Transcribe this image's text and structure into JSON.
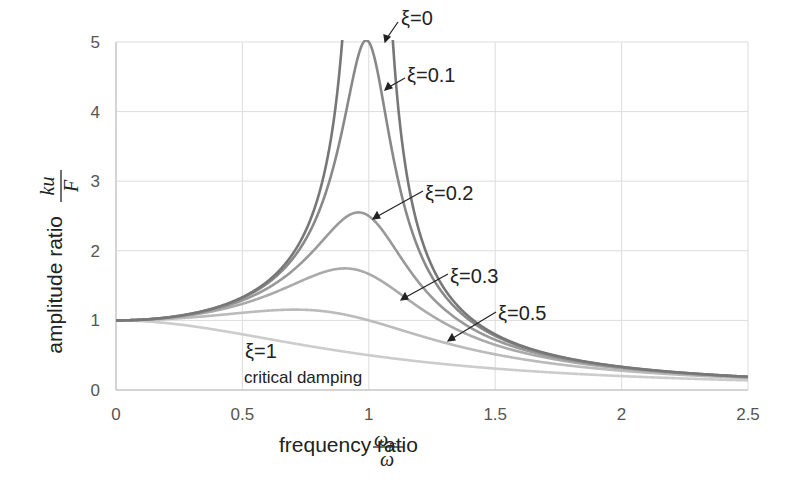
{
  "chart_data": {
    "type": "line",
    "title": "",
    "xlabel": "frequency ratio ωF/ω",
    "ylabel": "amplitude ratio ku/F",
    "xlim": [
      0,
      2.5
    ],
    "ylim": [
      0,
      5
    ],
    "xticks": [
      "0",
      "0.5",
      "1",
      "1.5",
      "2",
      "2.5"
    ],
    "yticks": [
      "0",
      "1",
      "2",
      "3",
      "4",
      "5"
    ],
    "grid": true,
    "legend": "inline annotations with arrows",
    "formula": "ku/F = 1 / sqrt((1 - r^2)^2 + (2 ξ r)^2)",
    "series": [
      {
        "name": "ξ=0",
        "xi": 0,
        "color": "#777777",
        "points": [
          [
            0,
            1
          ],
          [
            0.5,
            1.33
          ],
          [
            0.8,
            2.78
          ],
          [
            0.9,
            5.26
          ],
          [
            1.1,
            4.76
          ],
          [
            1.2,
            2.27
          ],
          [
            1.5,
            0.8
          ],
          [
            2,
            0.33
          ],
          [
            2.5,
            0.19
          ]
        ]
      },
      {
        "name": "ξ=0.1",
        "xi": 0.1,
        "color": "#888888",
        "points": [
          [
            0,
            1
          ],
          [
            0.5,
            1.32
          ],
          [
            0.8,
            2.54
          ],
          [
            0.9,
            3.82
          ],
          [
            1,
            5.0
          ],
          [
            1.1,
            3.29
          ],
          [
            1.2,
            2.02
          ],
          [
            1.5,
            0.78
          ],
          [
            2,
            0.33
          ],
          [
            2.5,
            0.19
          ]
        ]
      },
      {
        "name": "ξ=0.2",
        "xi": 0.2,
        "color": "#999999",
        "points": [
          [
            0,
            1
          ],
          [
            0.5,
            1.29
          ],
          [
            0.8,
            2.0
          ],
          [
            0.96,
            2.55
          ],
          [
            1,
            2.5
          ],
          [
            1.2,
            1.54
          ],
          [
            1.5,
            0.74
          ],
          [
            2,
            0.32
          ],
          [
            2.5,
            0.19
          ]
        ]
      },
      {
        "name": "ξ=0.3",
        "xi": 0.3,
        "color": "#aaaaaa",
        "points": [
          [
            0,
            1
          ],
          [
            0.5,
            1.24
          ],
          [
            0.9,
            1.75
          ],
          [
            1,
            1.67
          ],
          [
            1.2,
            1.19
          ],
          [
            1.5,
            0.67
          ],
          [
            2,
            0.31
          ],
          [
            2.5,
            0.18
          ]
        ]
      },
      {
        "name": "ξ=0.5",
        "xi": 0.5,
        "color": "#bbbbbb",
        "points": [
          [
            0,
            1
          ],
          [
            0.5,
            1.11
          ],
          [
            0.71,
            1.15
          ],
          [
            1,
            1.0
          ],
          [
            1.5,
            0.55
          ],
          [
            2,
            0.28
          ],
          [
            2.5,
            0.17
          ]
        ]
      },
      {
        "name": "ξ=1",
        "xi": 1,
        "color": "#cccccc",
        "points": [
          [
            0,
            1
          ],
          [
            0.5,
            0.8
          ],
          [
            1,
            0.5
          ],
          [
            1.5,
            0.31
          ],
          [
            2,
            0.2
          ],
          [
            2.5,
            0.14
          ]
        ]
      }
    ],
    "annotations": [
      {
        "text": "ξ=0"
      },
      {
        "text": "ξ=0.1"
      },
      {
        "text": "ξ=0.2"
      },
      {
        "text": "ξ=0.3"
      },
      {
        "text": "ξ=0.5"
      },
      {
        "text": "ξ=1"
      },
      {
        "text": "critical damping"
      }
    ]
  },
  "labels": {
    "ylabel_text": "amplitude ratio",
    "ylabel_num": "ku",
    "ylabel_den": "F",
    "xlabel_text": "frequency ratio",
    "xlabel_num": "ω",
    "xlabel_num_sub": "F",
    "xlabel_den": "ω"
  }
}
